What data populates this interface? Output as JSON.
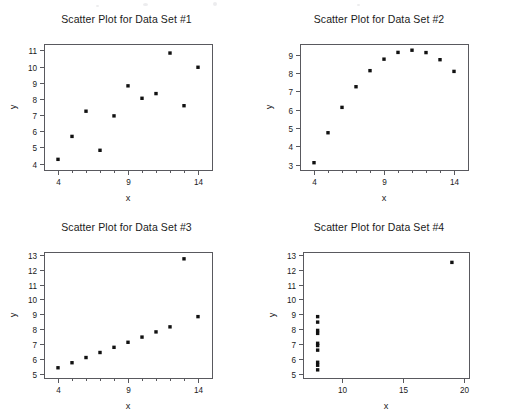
{
  "page": {
    "background_color": "#ffffff",
    "ink_color": "#1b1b1b",
    "axis_color": "#59595e",
    "marker_color": "#111111"
  },
  "chart_data": [
    {
      "type": "scatter",
      "title": "Scatter Plot for Data Set #1",
      "xlabel": "x",
      "ylabel": "y",
      "xlim": [
        3.0,
        15.0
      ],
      "ylim": [
        3.6,
        11.4
      ],
      "xticks": [
        4,
        9,
        14
      ],
      "xticklabels": [
        "4",
        "9",
        "14"
      ],
      "xminorticks": [
        5,
        6,
        7,
        8,
        10,
        11,
        12,
        13
      ],
      "yticks": [
        4,
        5,
        6,
        7,
        8,
        9,
        10,
        11
      ],
      "yticklabels": [
        "4",
        "5",
        "6",
        "7",
        "8",
        "9",
        "10",
        "11"
      ],
      "grid": false,
      "legend": false,
      "x": [
        10.0,
        8.0,
        13.0,
        9.0,
        11.0,
        14.0,
        6.0,
        4.0,
        12.0,
        7.0,
        5.0
      ],
      "y": [
        8.04,
        6.95,
        7.58,
        8.81,
        8.33,
        9.96,
        7.24,
        4.26,
        10.84,
        4.82,
        5.68
      ]
    },
    {
      "type": "scatter",
      "title": "Scatter Plot for Data Set #2",
      "xlabel": "x",
      "ylabel": "y",
      "xlim": [
        3.0,
        15.0
      ],
      "ylim": [
        2.7,
        9.6
      ],
      "xticks": [
        4,
        9,
        14
      ],
      "xticklabels": [
        "4",
        "9",
        "14"
      ],
      "xminorticks": [
        5,
        6,
        7,
        8,
        10,
        11,
        12,
        13
      ],
      "yticks": [
        3,
        4,
        5,
        6,
        7,
        8,
        9
      ],
      "yticklabels": [
        "3",
        "4",
        "5",
        "6",
        "7",
        "8",
        "9"
      ],
      "grid": false,
      "legend": false,
      "x": [
        10.0,
        8.0,
        13.0,
        9.0,
        11.0,
        14.0,
        6.0,
        4.0,
        12.0,
        7.0,
        5.0
      ],
      "y": [
        9.14,
        8.14,
        8.74,
        8.77,
        9.26,
        8.1,
        6.13,
        3.1,
        9.13,
        7.26,
        4.74
      ]
    },
    {
      "type": "scatter",
      "title": "Scatter Plot for Data Set #3",
      "xlabel": "x",
      "ylabel": "y",
      "xlim": [
        3.0,
        15.0
      ],
      "ylim": [
        4.7,
        13.2
      ],
      "xticks": [
        4,
        9,
        14
      ],
      "xticklabels": [
        "4",
        "9",
        "14"
      ],
      "xminorticks": [
        5,
        6,
        7,
        8,
        10,
        11,
        12,
        13
      ],
      "yticks": [
        5,
        6,
        7,
        8,
        9,
        10,
        11,
        12,
        13
      ],
      "yticklabels": [
        "5",
        "6",
        "7",
        "8",
        "9",
        "10",
        "11",
        "12",
        "13"
      ],
      "grid": false,
      "legend": false,
      "x": [
        10.0,
        8.0,
        13.0,
        9.0,
        11.0,
        14.0,
        6.0,
        4.0,
        12.0,
        7.0,
        5.0
      ],
      "y": [
        7.46,
        6.77,
        12.74,
        7.11,
        7.81,
        8.84,
        6.08,
        5.39,
        8.15,
        6.42,
        5.73
      ]
    },
    {
      "type": "scatter",
      "title": "Scatter Plot for Data Set #4",
      "xlabel": "x",
      "ylabel": "y",
      "xlim": [
        6.8,
        20.4
      ],
      "ylim": [
        4.7,
        13.2
      ],
      "xticks": [
        10,
        15,
        20
      ],
      "xticklabels": [
        "10",
        "15",
        "20"
      ],
      "xminorticks": [],
      "yticks": [
        5,
        6,
        7,
        8,
        9,
        10,
        11,
        12,
        13
      ],
      "yticklabels": [
        "5",
        "6",
        "7",
        "8",
        "9",
        "10",
        "11",
        "12",
        "13"
      ],
      "grid": false,
      "legend": false,
      "x": [
        8.0,
        8.0,
        8.0,
        8.0,
        8.0,
        8.0,
        8.0,
        19.0,
        8.0,
        8.0,
        8.0
      ],
      "y": [
        6.58,
        5.76,
        7.71,
        8.84,
        8.47,
        7.04,
        5.25,
        12.5,
        5.56,
        7.91,
        6.89
      ]
    }
  ]
}
